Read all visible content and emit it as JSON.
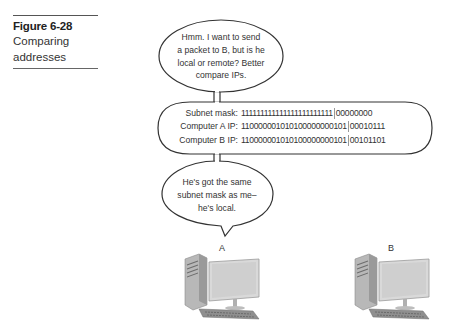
{
  "caption": {
    "figure_number": "Figure 6-28",
    "title_line1": "Comparing",
    "title_line2": "addresses"
  },
  "bubble_top": {
    "lines": [
      "Hmm. I want to send",
      "a packet to B, but is he",
      "local or remote? Better",
      "compare IPs."
    ]
  },
  "comparison": {
    "rows": [
      {
        "label": "Subnet mask:",
        "network": "111111111111111111111111",
        "host": "00000000"
      },
      {
        "label": "Computer A IP:",
        "network": "110000001010100000000101",
        "host": "00010111"
      },
      {
        "label": "Computer B IP:",
        "network": "110000001010100000000101",
        "host": "00101101"
      }
    ]
  },
  "bubble_bottom": {
    "lines": [
      "He's got the same",
      "subnet mask as me–",
      "he's local."
    ]
  },
  "computers": [
    {
      "label": "A",
      "icon": "desktop-computer-icon"
    },
    {
      "label": "B",
      "icon": "desktop-computer-icon"
    }
  ]
}
